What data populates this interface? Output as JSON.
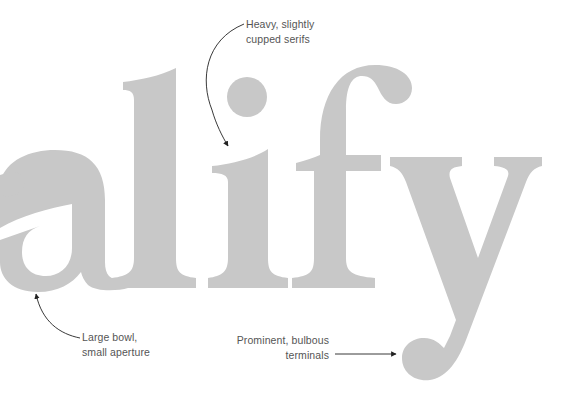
{
  "diagram": {
    "word": "alify",
    "glyph_color": "#c8c8c8",
    "annotation_color": "#555555",
    "arrow_color": "#222222",
    "annotations": [
      {
        "id": "serifs",
        "lines": [
          "Heavy, slightly",
          "cupped serifs"
        ],
        "target": "serif of letter i"
      },
      {
        "id": "bowl",
        "lines": [
          "Large bowl,",
          "small aperture"
        ],
        "target": "bowl of letter a"
      },
      {
        "id": "terminals",
        "lines": [
          "Prominent, bulbous",
          "terminals"
        ],
        "target": "terminal of letter y"
      }
    ]
  }
}
